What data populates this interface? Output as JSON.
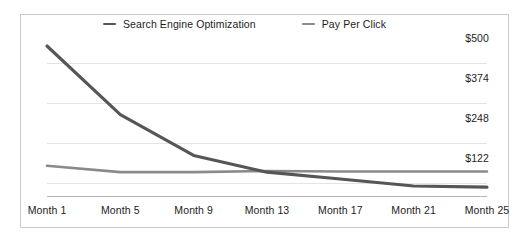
{
  "chart_data": {
    "type": "line",
    "title": "",
    "subtitle": "",
    "xlabel": "",
    "ylabel": "",
    "grid": true,
    "legend_position": "top-center",
    "xlim": [
      1,
      25
    ],
    "ylim": [
      0,
      500
    ],
    "x_tick_labels": [
      "Month 1",
      "Month 5",
      "Month 9",
      "Month 13",
      "Month 17",
      "Month 21",
      "Month 25"
    ],
    "x_tick_values": [
      1,
      5,
      9,
      13,
      17,
      21,
      25
    ],
    "y_tick_labels": [
      "$500",
      "$374",
      "$248",
      "$122"
    ],
    "y_tick_values": [
      500,
      374,
      248,
      122
    ],
    "x": [
      1,
      5,
      9,
      13,
      17,
      21,
      25
    ],
    "series": [
      {
        "name": "Search Engine Optimization",
        "color": "#565656",
        "values": [
          500,
          262,
          120,
          62,
          38,
          14,
          10
        ]
      },
      {
        "name": "Pay Per Click",
        "color": "#8a8a8a",
        "values": [
          84,
          62,
          62,
          66,
          64,
          64,
          64
        ]
      }
    ]
  },
  "legend": {
    "items": [
      {
        "label": "Search Engine Optimization",
        "swatch_icon": "line-swatch-icon",
        "color": "#565656"
      },
      {
        "label": "Pay Per Click",
        "swatch_icon": "line-swatch-icon",
        "color": "#8a8a8a"
      }
    ]
  },
  "axes": {
    "y_labels": [
      "$500",
      "$374",
      "$248",
      "$122"
    ],
    "x_labels": [
      "Month 1",
      "Month 5",
      "Month 9",
      "Month 13",
      "Month 17",
      "Month 21",
      "Month 25"
    ]
  },
  "colors": {
    "frame": "#c9c9c9",
    "gridline": "#e4e4e4",
    "baseline": "#b5b5b5",
    "text": "#1d1d1d",
    "background": "#ffffff"
  }
}
